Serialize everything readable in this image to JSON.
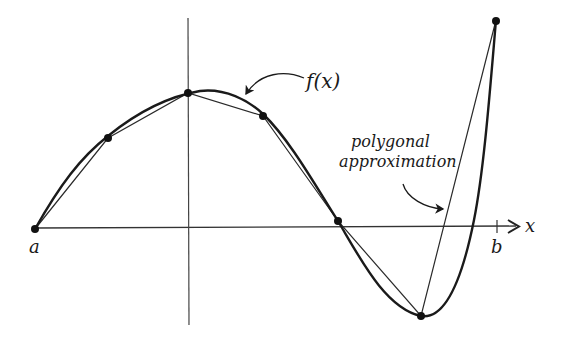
{
  "figure": {
    "labels": {
      "function": "f(x)",
      "approximation_line1": "polygonal",
      "approximation_line2": "approximation",
      "x_axis": "x",
      "left_endpoint": "a",
      "right_endpoint": "b"
    },
    "colors": {
      "curve": "#1a1a1a",
      "polygon": "#2a2a2a",
      "axes": "#333333",
      "nodes": "#111111"
    },
    "nodes": [
      {
        "name": "a",
        "x": 0.0,
        "y": 0.0
      },
      {
        "name": "p1",
        "x": 1.0,
        "y": 1.45
      },
      {
        "name": "p2",
        "x": 2.1,
        "y": 2.15
      },
      {
        "name": "p3",
        "x": 3.1,
        "y": 1.8
      },
      {
        "name": "p4",
        "x": 4.15,
        "y": 0.1
      },
      {
        "name": "p5",
        "x": 5.3,
        "y": -1.4
      },
      {
        "name": "b",
        "x": 6.3,
        "y": 3.3
      }
    ]
  }
}
